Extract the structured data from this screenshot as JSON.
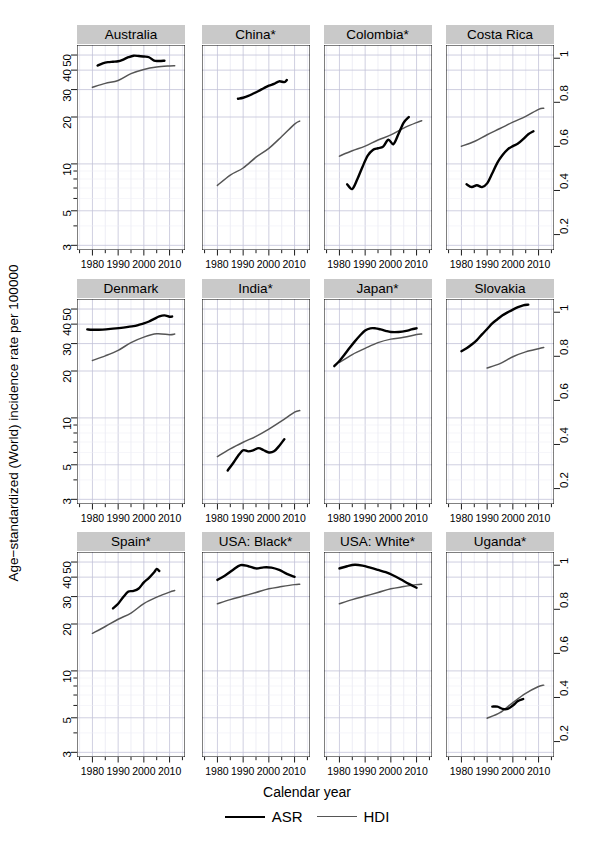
{
  "chart_data": {
    "type": "line",
    "title": "",
    "xlabel": "Calendar year",
    "ylabel": "Age−standardized (World) incidence rate per 100000",
    "y2label": "",
    "layout": {
      "rows": 3,
      "cols": 4,
      "grid": true,
      "legend_position": "bottom"
    },
    "x": {
      "scale": "linear",
      "min": 1974,
      "max": 2016,
      "ticks": [
        1980,
        1990,
        2000,
        2010
      ],
      "ticklabels": [
        "1980",
        "1990",
        "2000",
        "2010"
      ],
      "minor_ticks": [
        1975,
        1980,
        1985,
        1990,
        1995,
        2000,
        2005,
        2010,
        2015
      ]
    },
    "yleft": {
      "scale": "log",
      "min": 2.8,
      "max": 58,
      "ticks": [
        3,
        5,
        10,
        20,
        30,
        40,
        50
      ],
      "ticklabels": [
        "3",
        "5",
        "10",
        "20",
        "30",
        "40",
        "50"
      ],
      "label": "Age−standardized (World) incidence rate per 100000"
    },
    "yright": {
      "scale": "linear",
      "min": 0.13,
      "max": 1.06,
      "ticks": [
        0.2,
        0.4,
        0.6,
        0.8,
        1
      ],
      "ticklabels": [
        "0.2",
        "0.4",
        "0.6",
        "0.8",
        "1"
      ],
      "label": "HDI"
    },
    "legend": [
      {
        "name": "ASR",
        "color": "#000000",
        "width": 2.6
      },
      {
        "name": "HDI",
        "color": "#555555",
        "width": 1.6
      }
    ],
    "panels": [
      {
        "title": "Australia",
        "row": 0,
        "col": 0,
        "series": [
          {
            "name": "ASR",
            "axis": "left",
            "x": [
              1982,
              1984,
              1986,
              1988,
              1990,
              1992,
              1994,
              1996,
              1998,
              2000,
              2002,
              2004,
              2006,
              2008
            ],
            "y": [
              42.8,
              44.2,
              45.0,
              45.3,
              45.6,
              46.8,
              48.4,
              49.5,
              49.3,
              48.9,
              48.4,
              46.0,
              45.8,
              46.0
            ]
          },
          {
            "name": "HDI",
            "axis": "right",
            "x": [
              1980,
              1985,
              1990,
              1995,
              2000,
              2005,
              2010,
              2012
            ],
            "y": [
              0.868,
              0.886,
              0.899,
              0.93,
              0.949,
              0.96,
              0.965,
              0.966
            ]
          }
        ]
      },
      {
        "title": "China*",
        "row": 0,
        "col": 1,
        "series": [
          {
            "name": "ASR",
            "axis": "left",
            "x": [
              1988,
              1990,
              1992,
              1994,
              1996,
              1998,
              2000,
              2002,
              2004,
              2006,
              2007
            ],
            "y": [
              26.2,
              26.6,
              27.3,
              28.3,
              29.4,
              30.6,
              31.8,
              32.6,
              33.9,
              33.5,
              34.6
            ]
          },
          {
            "name": "HDI",
            "axis": "right",
            "x": [
              1980,
              1985,
              1990,
              1995,
              2000,
              2005,
              2010,
              2012
            ],
            "y": [
              0.423,
              0.47,
              0.502,
              0.551,
              0.591,
              0.645,
              0.701,
              0.715
            ]
          }
        ]
      },
      {
        "title": "Colombia*",
        "row": 0,
        "col": 2,
        "series": [
          {
            "name": "ASR",
            "axis": "left",
            "x": [
              1983,
              1985,
              1987,
              1989,
              1991,
              1993,
              1995,
              1997,
              1999,
              2001,
              2003,
              2005,
              2007
            ],
            "y": [
              7.4,
              6.9,
              8.0,
              9.6,
              11.3,
              12.3,
              12.6,
              12.9,
              14.3,
              13.4,
              15.6,
              18.4,
              20.0
            ]
          },
          {
            "name": "HDI",
            "axis": "right",
            "x": [
              1980,
              1985,
              1990,
              1995,
              2000,
              2005,
              2010,
              2012
            ],
            "y": [
              0.556,
              0.58,
              0.601,
              0.629,
              0.652,
              0.683,
              0.708,
              0.716
            ]
          }
        ]
      },
      {
        "title": "Costa Rica",
        "row": 0,
        "col": 3,
        "series": [
          {
            "name": "ASR",
            "axis": "left",
            "x": [
              1982,
              1984,
              1986,
              1988,
              1990,
              1992,
              1994,
              1996,
              1998,
              2000,
              2002,
              2004,
              2006,
              2008
            ],
            "y": [
              7.4,
              7.1,
              7.3,
              7.1,
              7.5,
              8.7,
              10.2,
              11.4,
              12.4,
              13.0,
              13.5,
              14.4,
              15.5,
              16.2
            ]
          },
          {
            "name": "HDI",
            "axis": "right",
            "x": [
              1980,
              1985,
              1990,
              1995,
              2000,
              2005,
              2010,
              2012
            ],
            "y": [
              0.601,
              0.622,
              0.653,
              0.681,
              0.71,
              0.736,
              0.768,
              0.773
            ]
          }
        ]
      },
      {
        "title": "Denmark",
        "row": 1,
        "col": 0,
        "series": [
          {
            "name": "ASR",
            "axis": "left",
            "x": [
              1978,
              1980,
              1984,
              1988,
              1992,
              1996,
              1998,
              2000,
              2002,
              2004,
              2006,
              2008,
              2010,
              2011
            ],
            "y": [
              37.0,
              36.8,
              36.9,
              37.4,
              38.0,
              38.8,
              39.6,
              40.4,
              41.6,
              43.2,
              44.8,
              45.5,
              44.6,
              44.8
            ]
          },
          {
            "name": "HDI",
            "axis": "right",
            "x": [
              1980,
              1985,
              1990,
              1995,
              2000,
              2005,
              2010,
              2012
            ],
            "y": [
              0.781,
              0.802,
              0.827,
              0.862,
              0.887,
              0.902,
              0.898,
              0.901
            ]
          }
        ]
      },
      {
        "title": "India*",
        "row": 1,
        "col": 1,
        "series": [
          {
            "name": "ASR",
            "axis": "left",
            "x": [
              1984,
              1986,
              1988,
              1990,
              1992,
              1994,
              1996,
              1998,
              2000,
              2002,
              2004,
              2006
            ],
            "y": [
              4.6,
              5.1,
              5.7,
              6.2,
              6.1,
              6.2,
              6.4,
              6.2,
              6.0,
              6.1,
              6.6,
              7.3
            ]
          },
          {
            "name": "HDI",
            "axis": "right",
            "x": [
              1980,
              1985,
              1990,
              1995,
              2000,
              2005,
              2010,
              2012
            ],
            "y": [
              0.345,
              0.38,
              0.41,
              0.437,
              0.47,
              0.507,
              0.547,
              0.554
            ]
          }
        ]
      },
      {
        "title": "Japan*",
        "row": 1,
        "col": 2,
        "series": [
          {
            "name": "ASR",
            "axis": "left",
            "x": [
              1978,
              1980,
              1982,
              1984,
              1986,
              1988,
              1990,
              1992,
              1994,
              1996,
              1998,
              2000,
              2003,
              2006,
              2008,
              2010
            ],
            "y": [
              21.5,
              23.2,
              25.5,
              28.2,
              31.0,
              33.8,
              36.4,
              37.6,
              37.6,
              37.0,
              36.2,
              35.6,
              35.6,
              36.2,
              37.0,
              37.6
            ]
          },
          {
            "name": "HDI",
            "axis": "right",
            "x": [
              1980,
              1985,
              1990,
              1995,
              2000,
              2005,
              2010,
              2012
            ],
            "y": [
              0.772,
              0.808,
              0.836,
              0.862,
              0.878,
              0.886,
              0.899,
              0.901
            ]
          }
        ]
      },
      {
        "title": "Slovakia",
        "row": 1,
        "col": 3,
        "series": [
          {
            "name": "ASR",
            "axis": "left",
            "x": [
              1980,
              1982,
              1984,
              1986,
              1988,
              1990,
              1992,
              1994,
              1996,
              1998,
              2000,
              2002,
              2004,
              2006
            ],
            "y": [
              26.8,
              28.0,
              29.6,
              31.6,
              34.4,
              37.2,
              40.4,
              43.0,
              45.6,
              47.6,
              49.6,
              51.4,
              52.8,
              53.4
            ]
          },
          {
            "name": "HDI",
            "axis": "right",
            "x": [
              1990,
              1995,
              2000,
              2005,
              2010,
              2012
            ],
            "y": [
              0.747,
              0.767,
              0.798,
              0.82,
              0.834,
              0.84
            ]
          }
        ]
      },
      {
        "title": "Spain*",
        "row": 2,
        "col": 0,
        "series": [
          {
            "name": "ASR",
            "axis": "left",
            "x": [
              1988,
              1990,
              1992,
              1994,
              1996,
              1998,
              2000,
              2002,
              2004,
              2005,
              2006
            ],
            "y": [
              25.2,
              27.0,
              29.8,
              32.3,
              32.6,
              33.8,
              37.0,
              39.6,
              43.0,
              45.2,
              43.8
            ]
          },
          {
            "name": "HDI",
            "axis": "right",
            "x": [
              1980,
              1985,
              1990,
              1995,
              2000,
              2005,
              2010,
              2012
            ],
            "y": [
              0.691,
              0.722,
              0.755,
              0.783,
              0.826,
              0.855,
              0.878,
              0.885
            ]
          }
        ]
      },
      {
        "title": "USA: Black*",
        "row": 2,
        "col": 1,
        "series": [
          {
            "name": "ASR",
            "axis": "left",
            "x": [
              1980,
              1983,
              1986,
              1989,
              1992,
              1995,
              1998,
              2001,
              2004,
              2007,
              2010
            ],
            "y": [
              38.4,
              41.0,
              44.5,
              47.8,
              47.0,
              45.5,
              46.2,
              46.0,
              44.5,
              42.0,
              40.2
            ]
          },
          {
            "name": "HDI",
            "axis": "right",
            "x": [
              1980,
              1985,
              1990,
              1995,
              2000,
              2005,
              2010,
              2012
            ],
            "y": [
              0.825,
              0.844,
              0.86,
              0.876,
              0.893,
              0.903,
              0.912,
              0.914
            ]
          }
        ]
      },
      {
        "title": "USA: White*",
        "row": 2,
        "col": 2,
        "series": [
          {
            "name": "ASR",
            "axis": "left",
            "x": [
              1980,
              1983,
              1986,
              1989,
              1992,
              1995,
              1998,
              2001,
              2004,
              2007,
              2010
            ],
            "y": [
              45.5,
              47.0,
              48.0,
              47.4,
              46.0,
              44.5,
              43.0,
              41.0,
              38.6,
              36.2,
              34.2
            ]
          },
          {
            "name": "HDI",
            "axis": "right",
            "x": [
              1980,
              1985,
              1990,
              1995,
              2000,
              2005,
              2010,
              2012
            ],
            "y": [
              0.825,
              0.844,
              0.86,
              0.876,
              0.893,
              0.903,
              0.912,
              0.914
            ]
          }
        ]
      },
      {
        "title": "Uganda*",
        "row": 2,
        "col": 3,
        "series": [
          {
            "name": "ASR",
            "axis": "left",
            "x": [
              1992,
              1994,
              1996,
              1998,
              2000,
              2002,
              2004
            ],
            "y": [
              5.9,
              5.9,
              5.7,
              5.7,
              6.0,
              6.4,
              6.6
            ]
          },
          {
            "name": "HDI",
            "axis": "right",
            "x": [
              1990,
              1995,
              2000,
              2005,
              2010,
              2012
            ],
            "y": [
              0.306,
              0.331,
              0.377,
              0.419,
              0.45,
              0.456
            ]
          }
        ]
      }
    ]
  },
  "figure": {
    "xlabel": "Calendar year",
    "ylabel": "Age−standardized (World) incidence rate per 100000",
    "legend": {
      "asr": "ASR",
      "hdi": "HDI"
    },
    "xticklabels": [
      "1980",
      "1990",
      "2000",
      "2010"
    ],
    "ylefttlabels": [
      "50",
      "40",
      "30",
      "20",
      "10",
      "5",
      "3"
    ],
    "yrightlabels": [
      "1",
      "0.8",
      "0.6",
      "0.4",
      "0.2"
    ],
    "panel_titles": [
      "Australia",
      "China*",
      "Colombia*",
      "Costa Rica",
      "Denmark",
      "India*",
      "Japan*",
      "Slovakia",
      "Spain*",
      "USA: Black*",
      "USA: White*",
      "Uganda*"
    ],
    "colors": {
      "asr": "#000000",
      "hdi": "#555555",
      "strip": "#c9c9c9",
      "grid": "#d9d9e6",
      "axis": "#000000"
    }
  }
}
